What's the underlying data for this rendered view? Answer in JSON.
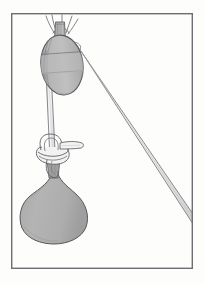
{
  "document": {
    "kind": "technical-line-illustration",
    "subject": "single-sheave pulley block with rope hoisting a load sack",
    "caption": "",
    "background_color": "#fdfdfc"
  },
  "frame": {
    "name": "illustration-border",
    "x": 11,
    "y": 13,
    "width": 182,
    "height": 256,
    "stroke_color": "#6d6d72",
    "stroke_width": 1.4,
    "fill": "none"
  },
  "palette": {
    "outline": "#57575c",
    "line_light": "#8b8b90",
    "block_fill": "#b9b9b9",
    "block_shadow": "#a4a4a4",
    "block_highlight": "#c8c8c8",
    "sack_fill": "#b0b0b0",
    "sack_shadow": "#a0a0a0",
    "rope_fill": "#f4f4f4",
    "strap_fill": "#a8a8a8",
    "background": "#fdfdfc"
  },
  "parts": [
    {
      "id": "head-seizing",
      "label": "rope seizing at block head",
      "type": "rope-whipping",
      "center_x": 60,
      "center_y": 21,
      "strand_count": 5
    },
    {
      "id": "block-strap",
      "label": "block strap / becket",
      "type": "strap",
      "x": 54,
      "y": 22,
      "width": 11,
      "height": 16
    },
    {
      "id": "pulley-block",
      "label": "single-sheave pulley block shell",
      "type": "ellipse",
      "center_x": 62,
      "center_y": 65,
      "radius_x": 21,
      "radius_y": 30,
      "rotation_deg": -7
    },
    {
      "id": "sheave-groove",
      "label": "sheave groove band",
      "type": "band",
      "top_y": 55,
      "bottom_y": 74
    },
    {
      "id": "standing-part",
      "label": "standing part of rope descending to knot",
      "type": "rope-run",
      "from_x": 50,
      "from_y": 78,
      "to_x": 52,
      "to_y": 143,
      "rope_width": 5
    },
    {
      "id": "hauling-part",
      "label": "hauling part of rope leading off to lower right",
      "type": "rope-run",
      "from_x": 79,
      "from_y": 48,
      "to_x": 193,
      "to_y": 222,
      "rope_width": 5
    },
    {
      "id": "load-knot",
      "label": "knot securing rope to sack neck",
      "type": "knot",
      "center_x": 53,
      "center_y": 152,
      "radius_x": 16,
      "radius_y": 13
    },
    {
      "id": "knot-tail",
      "label": "free rope tail of knot",
      "type": "rope-tail",
      "from_x": 60,
      "from_y": 148,
      "to_x": 82,
      "to_y": 146
    },
    {
      "id": "sack-neck",
      "label": "gathered neck of sack",
      "type": "neck",
      "x": 46,
      "y": 165,
      "width": 16,
      "height": 18
    },
    {
      "id": "load-sack",
      "label": "suspended load sack",
      "type": "teardrop",
      "apex_x": 54,
      "apex_y": 170,
      "center_x": 53,
      "center_y": 212,
      "radius_x": 35,
      "radius_y": 30
    }
  ],
  "annotations": {
    "visible_text": []
  }
}
